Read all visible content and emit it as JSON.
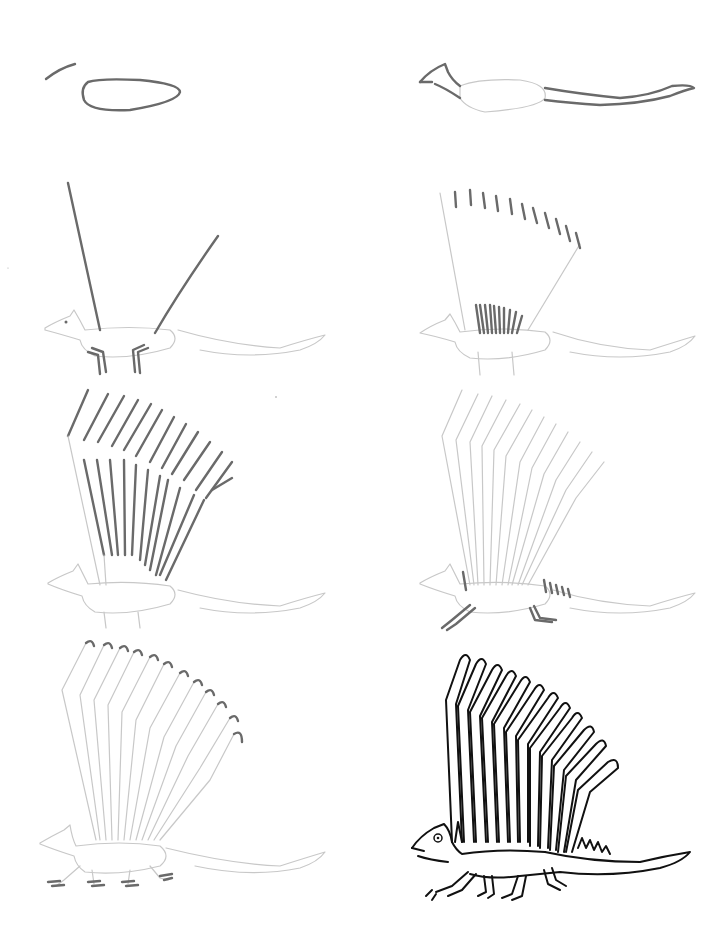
{
  "page": {
    "title": "",
    "background": "#ffffff"
  },
  "steps": [
    {
      "step": 1,
      "desc": "oval body and head guide line"
    },
    {
      "step": 2,
      "desc": "head and tail outline"
    },
    {
      "step": 3,
      "desc": "sail guide lines and legs"
    },
    {
      "step": 4,
      "desc": "spine ticks along sail top and base"
    },
    {
      "step": 5,
      "desc": "sail spines drawn"
    },
    {
      "step": 6,
      "desc": "back spikes and front/back legs"
    },
    {
      "step": 7,
      "desc": "hooked spine tips and feet"
    },
    {
      "step": 8,
      "desc": "final inked Edaphosaurus"
    }
  ],
  "colors": {
    "pencil_light": "#c8c8c8",
    "pencil_dark": "#6a6a6a",
    "ink": "#111111"
  }
}
